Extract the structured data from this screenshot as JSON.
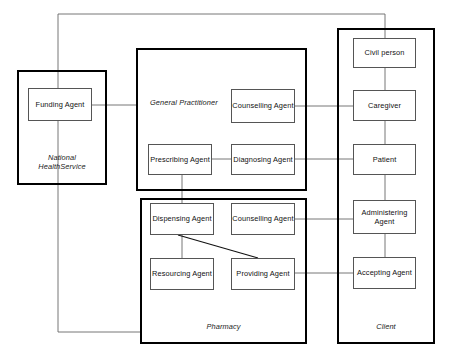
{
  "diagram": {
    "stroke_color": "#000000",
    "agent_border_color": "#555555",
    "edge_color": "#666666",
    "background": "#ffffff"
  },
  "containers": [
    {
      "id": "nhs",
      "label": "National\nHealthService",
      "x": 17,
      "y": 70,
      "w": 90,
      "h": 115
    },
    {
      "id": "gp",
      "label": "General Practitioner",
      "x": 136,
      "y": 48,
      "w": 171,
      "h": 143
    },
    {
      "id": "pharmacy",
      "label": "Pharmacy",
      "x": 140,
      "y": 198,
      "w": 167,
      "h": 146
    },
    {
      "id": "client",
      "label": "Client",
      "x": 337,
      "y": 28,
      "w": 98,
      "h": 316
    }
  ],
  "agents": [
    {
      "id": "funding",
      "label": "Funding Agent",
      "x": 28,
      "y": 88,
      "w": 64,
      "h": 33
    },
    {
      "id": "counselling_gp",
      "label": "Counselling Agent",
      "x": 231,
      "y": 89,
      "w": 64,
      "h": 34
    },
    {
      "id": "prescribing",
      "label": "Prescribing Agent",
      "x": 148,
      "y": 144,
      "w": 64,
      "h": 31
    },
    {
      "id": "diagnosing",
      "label": "Diagnosing Agent",
      "x": 231,
      "y": 144,
      "w": 64,
      "h": 31
    },
    {
      "id": "dispensing",
      "label": "Dispensing Agent",
      "x": 150,
      "y": 203,
      "w": 64,
      "h": 32
    },
    {
      "id": "counselling_ph",
      "label": "Counselling Agent",
      "x": 231,
      "y": 203,
      "w": 64,
      "h": 32
    },
    {
      "id": "resourcing",
      "label": "Resourcing Agent",
      "x": 150,
      "y": 258,
      "w": 64,
      "h": 32
    },
    {
      "id": "providing",
      "label": "Providing Agent",
      "x": 231,
      "y": 258,
      "w": 64,
      "h": 32
    },
    {
      "id": "civil_person",
      "label": "Civil person",
      "x": 353,
      "y": 38,
      "w": 63,
      "h": 30
    },
    {
      "id": "caregiver",
      "label": "Caregiver",
      "x": 353,
      "y": 90,
      "w": 63,
      "h": 31
    },
    {
      "id": "patient",
      "label": "Patient",
      "x": 353,
      "y": 144,
      "w": 63,
      "h": 31
    },
    {
      "id": "administering",
      "label": "Administering\nAgent",
      "x": 353,
      "y": 200,
      "w": 63,
      "h": 34
    },
    {
      "id": "accepting",
      "label": "Accepting Agent",
      "x": 353,
      "y": 257,
      "w": 63,
      "h": 32
    }
  ],
  "edges": [
    {
      "id": "edge-funding-to-civilperson",
      "from": "funding",
      "to": "civil_person",
      "points": "58,105 58,14 385,14 385,38"
    },
    {
      "id": "edge-funding-to-pharmacy",
      "from": "funding",
      "to": "pharmacy",
      "points": "58,121 58,332 140,332"
    },
    {
      "id": "edge-funding-to-gp",
      "from": "funding",
      "to": "gp",
      "points": "92,105 136,105"
    },
    {
      "id": "edge-counsellinggp-to-caregiver",
      "from": "counselling_gp",
      "to": "caregiver",
      "points": "295,106 353,106"
    },
    {
      "id": "edge-prescribing-to-diagnosing",
      "from": "prescribing",
      "to": "diagnosing",
      "points": "212,159 231,159"
    },
    {
      "id": "edge-diagnosing-to-patient",
      "from": "diagnosing",
      "to": "patient",
      "points": "295,159 353,159"
    },
    {
      "id": "edge-prescribing-to-dispensing",
      "from": "prescribing",
      "to": "dispensing",
      "points": "182,175 182,203"
    },
    {
      "id": "edge-counsellingph-to-administering",
      "from": "counselling_ph",
      "to": "administering",
      "points": "295,219 353,219"
    },
    {
      "id": "edge-providing-to-accepting",
      "from": "providing",
      "to": "accepting",
      "points": "295,273 353,273"
    },
    {
      "id": "edge-dispensing-to-resourcing",
      "from": "dispensing",
      "to": "resourcing",
      "points": "182,235 182,258"
    },
    {
      "id": "edge-dispensing-to-providing",
      "from": "dispensing",
      "to": "providing",
      "points": "178,235 258,258",
      "dark": true
    },
    {
      "id": "edge-civilperson-to-caregiver",
      "from": "civil_person",
      "to": "caregiver",
      "points": "385,68 385,90"
    },
    {
      "id": "edge-caregiver-to-patient",
      "from": "caregiver",
      "to": "patient",
      "points": "385,121 385,144"
    },
    {
      "id": "edge-patient-to-administering",
      "from": "patient",
      "to": "administering",
      "points": "385,175 385,200"
    },
    {
      "id": "edge-administering-to-accepting",
      "from": "administering",
      "to": "accepting",
      "points": "385,234 385,257"
    }
  ]
}
